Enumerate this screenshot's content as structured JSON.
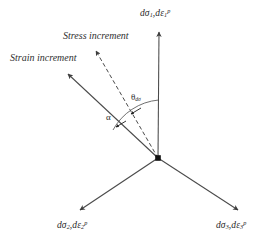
{
  "figure": {
    "type": "vector-diagram",
    "background_color": "#ffffff",
    "line_color": "#4a4a4a",
    "text_color": "#2a2a2a",
    "origin": {
      "x": 158,
      "y": 158
    }
  },
  "axes": [
    {
      "id": "axis-sigma-1",
      "name": "vertical-axis",
      "label_prefix": "d",
      "label_sigma": "σ",
      "label_sigma_sub": "1",
      "label_mid": ",d",
      "label_eps": "ε",
      "label_eps_sub": "1",
      "label_eps_sup": "p",
      "tip": {
        "x": 159,
        "y": 30
      }
    },
    {
      "id": "axis-sigma-2",
      "name": "lower-left-axis",
      "label_prefix": "d",
      "label_sigma": "σ",
      "label_sigma_sub": "2",
      "label_mid": ",d",
      "label_eps": "ε",
      "label_eps_sub": "2",
      "label_eps_sup": "p",
      "tip": {
        "x": 78,
        "y": 212
      }
    },
    {
      "id": "axis-sigma-3",
      "name": "lower-right-axis",
      "label_prefix": "d",
      "label_sigma": "σ",
      "label_sigma_sub": "3",
      "label_mid": ",d",
      "label_eps": "ε",
      "label_eps_sub": "3",
      "label_eps_sup": "p",
      "tip": {
        "x": 240,
        "y": 212
      }
    }
  ],
  "vectors": [
    {
      "id": "strain-increment",
      "label": "Strain increment",
      "style": "solid",
      "tip": {
        "x": 66,
        "y": 72
      }
    },
    {
      "id": "stress-increment",
      "label": "Stress increment",
      "style": "dashed",
      "tip": {
        "x": 94,
        "y": 48
      }
    }
  ],
  "angles": [
    {
      "id": "theta-dsigma",
      "symbol": "θ",
      "subscript": "dσ",
      "between": [
        "axis-sigma-1",
        "stress-increment"
      ]
    },
    {
      "id": "alpha",
      "symbol": "α",
      "subscript": "",
      "between": [
        "stress-increment",
        "strain-increment"
      ]
    }
  ]
}
